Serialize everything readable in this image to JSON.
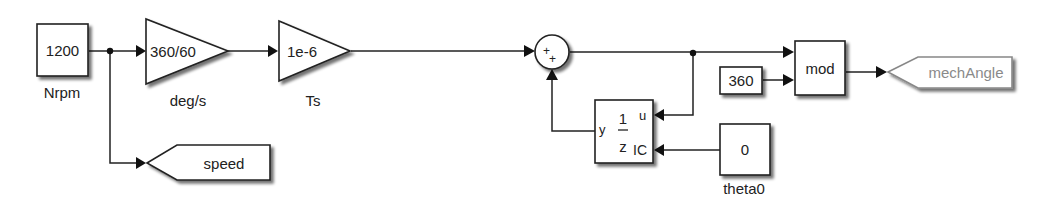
{
  "diagram": {
    "type": "simulink-block-diagram",
    "blocks": {
      "nrpm_const": {
        "value": "1200",
        "name": "Nrpm"
      },
      "gain_degs": {
        "value": "360/60",
        "name": "deg/s"
      },
      "gain_ts": {
        "value": "1e-6",
        "name": "Ts"
      },
      "sum": {
        "signs": [
          "+",
          "+"
        ]
      },
      "unit_delay": {
        "numerator": "1",
        "denominator": "z",
        "port_u": "u",
        "port_ic": "IC",
        "port_y": "y"
      },
      "const_360": {
        "value": "360"
      },
      "mod_block": {
        "label": "mod"
      },
      "goto_mech_angle": {
        "tag": "mechAngle"
      },
      "theta0_const": {
        "value": "0",
        "name": "theta0"
      },
      "goto_speed": {
        "tag": "speed"
      }
    },
    "connections": [
      "Nrpm -> deg/s",
      "Nrpm -> speed",
      "deg/s -> Ts",
      "Ts -> sum(+)",
      "sum -> mod(in1)",
      "sum -> unit_delay(u)",
      "unit_delay(y) -> sum(+)",
      "360 -> mod(in2)",
      "theta0 -> unit_delay(IC)",
      "mod -> mechAngle"
    ]
  }
}
